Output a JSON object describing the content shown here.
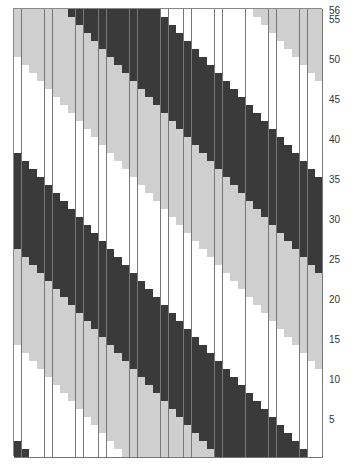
{
  "chart": {
    "rows": 56,
    "columns": 40,
    "stripe_width": 12,
    "period": 36,
    "phase_offset": 9,
    "colors": {
      "dark": "#3a3a3a",
      "white": "#ffffff",
      "grey": "#cfcfcf"
    },
    "stripe_order": [
      "dark",
      "white",
      "grey"
    ],
    "row_labels": [
      {
        "row": 56,
        "label": "56"
      },
      {
        "row": 55,
        "label": "55"
      },
      {
        "row": 50,
        "label": "50"
      },
      {
        "row": 45,
        "label": "45"
      },
      {
        "row": 40,
        "label": "40"
      },
      {
        "row": 35,
        "label": "35"
      },
      {
        "row": 30,
        "label": "30"
      },
      {
        "row": 25,
        "label": "25"
      },
      {
        "row": 20,
        "label": "20"
      },
      {
        "row": 15,
        "label": "15"
      },
      {
        "row": 10,
        "label": "10"
      },
      {
        "row": 5,
        "label": "5"
      }
    ]
  }
}
